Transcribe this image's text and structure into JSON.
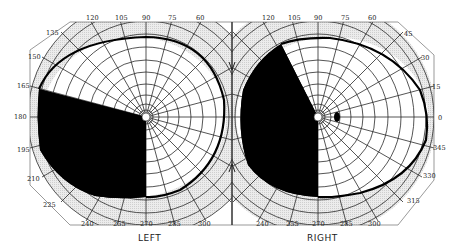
{
  "figure": {
    "type": "visual-field-perimetry",
    "eyes": [
      {
        "id": "left",
        "label": "LEFT",
        "center": [
          146,
          117
        ],
        "outer_radius": 115,
        "meridian_labels": [
          "120",
          "105",
          "90",
          "75",
          "60",
          "135",
          "150",
          "165",
          "180",
          "195",
          "210",
          "225",
          "240",
          "255",
          "270",
          "285",
          "300"
        ],
        "defect": "dense scotoma in lower-temporal quadrant, from 165° to 270°"
      },
      {
        "id": "right",
        "label": "RIGHT",
        "center": [
          318,
          117
        ],
        "outer_radius": 115,
        "meridian_labels": [
          "120",
          "105",
          "90",
          "75",
          "60",
          "45",
          "30",
          "15",
          "0",
          "345",
          "330",
          "315",
          "240",
          "255",
          "270",
          "285",
          "300"
        ],
        "defect": "dense scotoma in left hemifield, from ~117° to 270°; small blind spot at ~15° temporal"
      }
    ],
    "colors": {
      "scotoma": "#000000",
      "grid": "#2a2a2a",
      "isopter": "#000000",
      "outer_band": "#e4e4e4",
      "background": "#ffffff"
    }
  },
  "labels": {
    "left_eye": "LEFT",
    "right_eye": "RIGHT",
    "left_top": [
      "120",
      "105",
      "90",
      "75",
      "60"
    ],
    "left_side": [
      "135",
      "150",
      "165",
      "180",
      "195",
      "210",
      "225"
    ],
    "left_bottom": [
      "240",
      "255",
      "270",
      "285",
      "300"
    ],
    "right_top": [
      "120",
      "105",
      "90",
      "75",
      "60"
    ],
    "right_side": [
      "45",
      "30",
      "15",
      "0",
      "345",
      "330",
      "315"
    ],
    "right_bottom": [
      "240",
      "255",
      "270",
      "285",
      "300"
    ]
  }
}
